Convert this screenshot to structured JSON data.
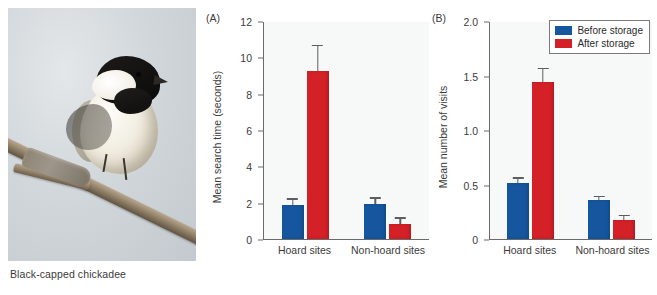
{
  "photo": {
    "caption": "Black-capped chickadee",
    "alt_name": "black-capped-chickadee-photo"
  },
  "legend": {
    "position": "top-right",
    "items": [
      {
        "label": "Before storage",
        "color": "#15569e"
      },
      {
        "label": "After storage",
        "color": "#d42027"
      }
    ]
  },
  "panels": [
    {
      "tag": "(A)",
      "ylabel": "Mean search time (seconds)",
      "ticks": [
        "12",
        "10",
        "8",
        "6",
        "4",
        "2",
        "0"
      ],
      "categories": [
        "Hoard sites",
        "Non-hoard sites"
      ]
    },
    {
      "tag": "(B)",
      "ylabel": "Mean number of visits",
      "ticks": [
        "2.0",
        "1.5",
        "1.0",
        "0.5",
        "0"
      ],
      "categories": [
        "Hoard sites",
        "Non-hoard sites"
      ]
    }
  ],
  "chart_data": [
    {
      "type": "bar",
      "panel": "(A)",
      "title": "",
      "xlabel": "",
      "ylabel": "Mean search time (seconds)",
      "ylim": [
        0,
        12
      ],
      "yticks": [
        0,
        2,
        4,
        6,
        8,
        10,
        12
      ],
      "grid": false,
      "legend_position": "top-right (shared, drawn on panel B)",
      "categories": [
        "Hoard sites",
        "Non-hoard sites"
      ],
      "series": [
        {
          "name": "Before storage",
          "color": "#15569e",
          "values": [
            1.85,
            1.95
          ],
          "errors_upper": [
            2.25,
            2.3
          ],
          "errors_lower": [
            1.45,
            1.6
          ]
        },
        {
          "name": "After storage",
          "color": "#d42027",
          "values": [
            9.25,
            0.85
          ],
          "errors_upper": [
            10.7,
            1.2
          ],
          "errors_lower": [
            7.8,
            0.5
          ]
        }
      ]
    },
    {
      "type": "bar",
      "panel": "(B)",
      "title": "",
      "xlabel": "",
      "ylabel": "Mean number of visits",
      "ylim": [
        0,
        2.0
      ],
      "yticks": [
        0,
        0.5,
        1.0,
        1.5,
        2.0
      ],
      "grid": false,
      "legend_position": "top-right",
      "categories": [
        "Hoard sites",
        "Non-hoard sites"
      ],
      "series": [
        {
          "name": "Before storage",
          "color": "#15569e",
          "values": [
            0.51,
            0.36
          ],
          "errors_upper": [
            0.565,
            0.395
          ],
          "errors_lower": [
            0.455,
            0.325
          ]
        },
        {
          "name": "After storage",
          "color": "#d42027",
          "values": [
            1.44,
            0.17
          ],
          "errors_upper": [
            1.57,
            0.225
          ],
          "errors_lower": [
            1.31,
            0.115
          ]
        }
      ]
    }
  ]
}
